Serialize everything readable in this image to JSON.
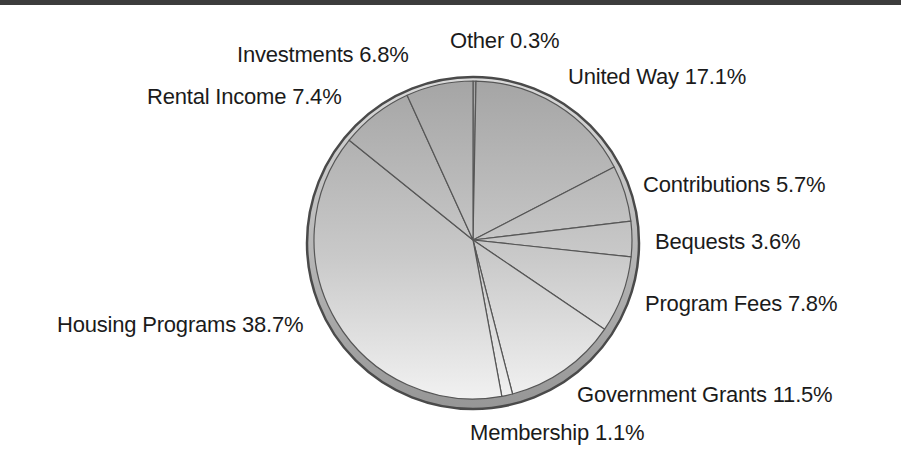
{
  "page": {
    "background": "#ffffff",
    "top_rule_color": "#3c3c3c"
  },
  "chart_data": {
    "type": "pie",
    "title": "",
    "categories": [
      "Other",
      "United Way",
      "Contributions",
      "Bequests",
      "Program Fees",
      "Government Grants",
      "Membership",
      "Housing Programs",
      "Rental Income",
      "Investments"
    ],
    "values": [
      0.3,
      17.1,
      5.7,
      3.6,
      7.8,
      11.5,
      1.1,
      38.7,
      7.4,
      6.8
    ],
    "units": "percent",
    "total": 100.0,
    "start_angle_deg": 0,
    "direction": "clockwise",
    "legend_position": "labels-around-pie",
    "slices": [
      {
        "label": "Other",
        "value": 0.3,
        "display": "Other 0.3%"
      },
      {
        "label": "United Way",
        "value": 17.1,
        "display": "United Way 17.1%"
      },
      {
        "label": "Contributions",
        "value": 5.7,
        "display": "Contributions 5.7%"
      },
      {
        "label": "Bequests",
        "value": 3.6,
        "display": "Bequests 3.6%"
      },
      {
        "label": "Program Fees",
        "value": 7.8,
        "display": "Program Fees 7.8%"
      },
      {
        "label": "Government Grants",
        "value": 11.5,
        "display": "Government Grants 11.5%"
      },
      {
        "label": "Membership",
        "value": 1.1,
        "display": "Membership 1.1%"
      },
      {
        "label": "Housing Programs",
        "value": 38.7,
        "display": "Housing Programs 38.7%"
      },
      {
        "label": "Rental Income",
        "value": 7.4,
        "display": "Rental Income 7.4%"
      },
      {
        "label": "Investments",
        "value": 6.8,
        "display": "Investments 6.8%"
      }
    ],
    "colors": {
      "surface_top": "#a5a5a5",
      "surface_bottom": "#f1f1f1",
      "rim_top": "#dadada",
      "rim_bottom": "#969696",
      "outline": "#4a4a4a",
      "slice_line": "#565656",
      "label_text": "#1b1b1b"
    }
  }
}
